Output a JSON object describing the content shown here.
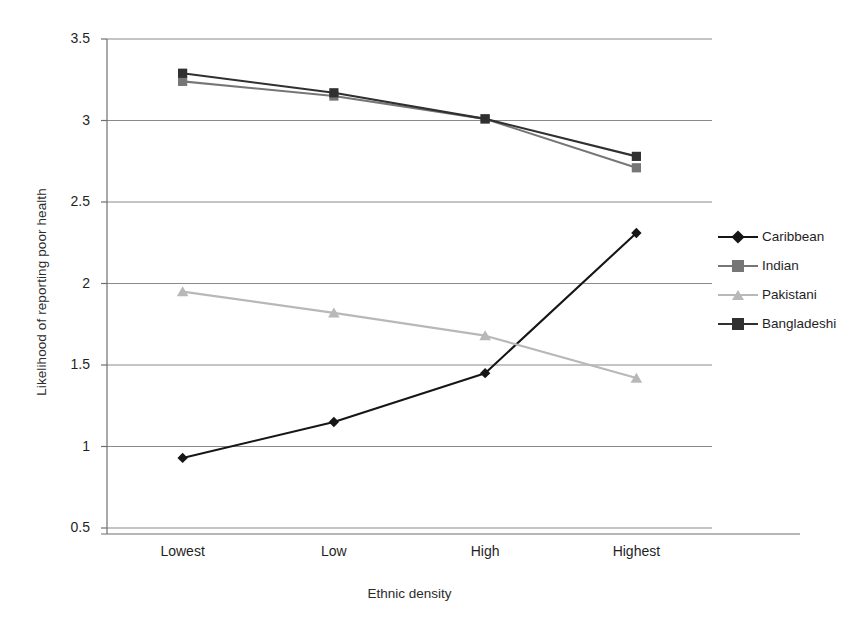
{
  "chart_data": {
    "type": "line",
    "title": "",
    "xlabel": "Ethnic density",
    "ylabel": "Likelihood of reporting poor health",
    "categories": [
      "Lowest",
      "Low",
      "High",
      "Highest"
    ],
    "ylim": [
      0.5,
      3.5
    ],
    "ytick_labels": [
      "3.5",
      "3",
      "2.5",
      "2",
      "1.5",
      "1",
      "0.5"
    ],
    "ytick_values": [
      3.5,
      3,
      2.5,
      2,
      1.5,
      1,
      0.5
    ],
    "grid": "horizontal",
    "legend_position": "right",
    "series": [
      {
        "name": "Caribbean",
        "marker": "diamond",
        "color": "#161616",
        "values": [
          0.93,
          1.15,
          1.45,
          2.31
        ]
      },
      {
        "name": "Indian",
        "marker": "square",
        "color": "#767676",
        "values": [
          3.24,
          3.15,
          3.01,
          2.71
        ]
      },
      {
        "name": "Pakistani",
        "marker": "triangle",
        "color": "#b8b8b8",
        "values": [
          1.95,
          1.82,
          1.68,
          1.42
        ]
      },
      {
        "name": "Bangladeshi",
        "marker": "square",
        "color": "#303030",
        "values": [
          3.29,
          3.17,
          3.01,
          2.78
        ]
      }
    ]
  },
  "axes": {
    "y_title": "Likelihood of reporting poor health",
    "x_title": "Ethnic density"
  },
  "legend": {
    "items": [
      {
        "label": "Caribbean"
      },
      {
        "label": "Indian"
      },
      {
        "label": "Pakistani"
      },
      {
        "label": "Bangladeshi"
      }
    ]
  },
  "colors": {
    "axis": "#6f6f6f",
    "grid": "#8a8a8a",
    "text": "#1f1f1f",
    "background": "#ffffff"
  }
}
